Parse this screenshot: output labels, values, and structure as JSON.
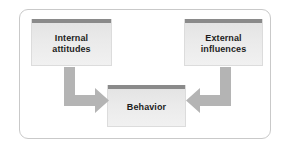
{
  "diagram": {
    "type": "flow-diagram",
    "frame": {
      "border_color": "#c9c9c9",
      "background_color": "#ffffff"
    },
    "nodes": [
      {
        "id": "internal-attitudes",
        "label": "Internal\nattitudes",
        "bar_color": "#8a8a8a",
        "fill_color": "#e9e9e9",
        "position": "top-left"
      },
      {
        "id": "external-influences",
        "label": "External\ninfluences",
        "bar_color": "#8a8a8a",
        "fill_color": "#e9e9e9",
        "position": "top-right"
      },
      {
        "id": "behavior",
        "label": "Behavior",
        "bar_color": "#8a8a8a",
        "fill_color": "#e9e9e9",
        "position": "bottom-center"
      }
    ],
    "arrows": [
      {
        "id": "arrow-internal-to-behavior",
        "from": "internal-attitudes",
        "to": "behavior",
        "shape": "elbow-down-right",
        "color": "#b4b4b4"
      },
      {
        "id": "arrow-external-to-behavior",
        "from": "external-influences",
        "to": "behavior",
        "shape": "elbow-down-left",
        "color": "#b4b4b4"
      }
    ]
  }
}
